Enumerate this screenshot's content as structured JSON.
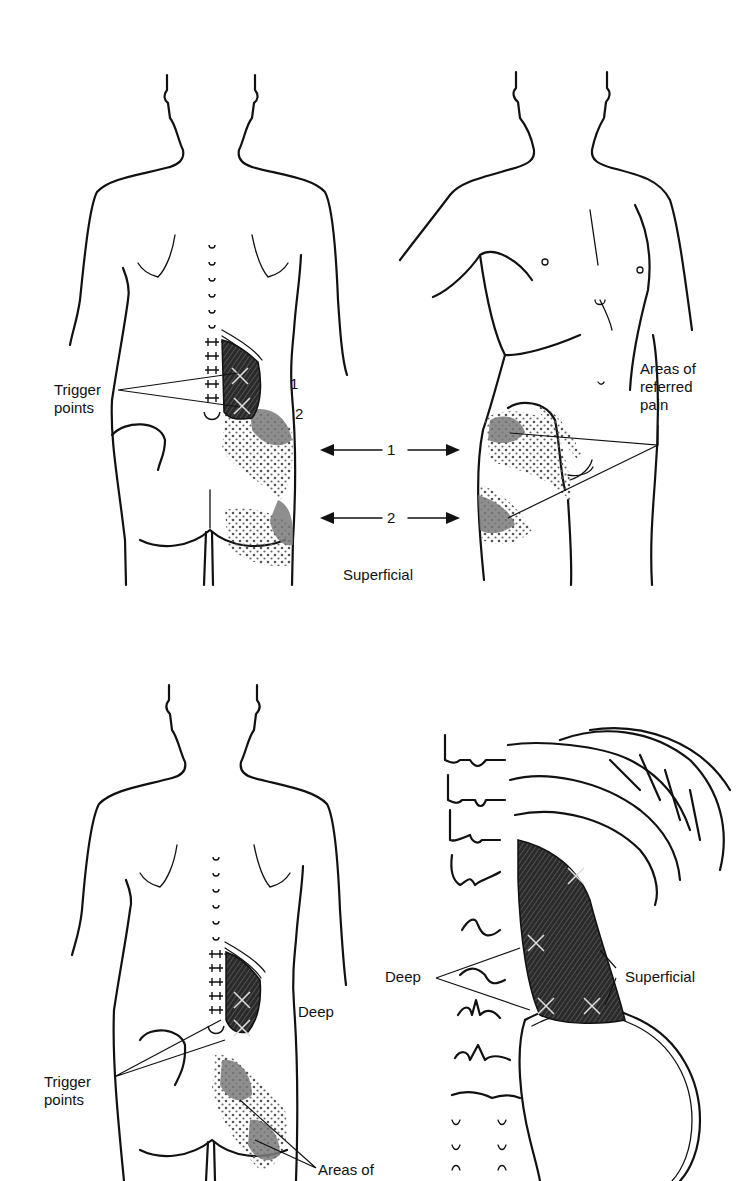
{
  "figure": {
    "panels": [
      {
        "id": "superficial",
        "views": [
          "posterior-torso",
          "anterolateral-torso"
        ],
        "labels": {
          "trigger_points": "Trigger\npoints",
          "marker_1": "1",
          "marker_2": "2",
          "arrow_1": "1",
          "arrow_2": "2",
          "areas_referred": "Areas of\nreferred\npain",
          "caption": "Superficial"
        }
      },
      {
        "id": "deep",
        "views": [
          "posterior-torso",
          "lumbar-spine-detail"
        ],
        "labels": {
          "trigger_points": "Trigger\npoints",
          "deep": "Deep",
          "areas_of": "Areas of",
          "detail_deep": "Deep",
          "detail_superficial": "Superficial"
        }
      }
    ],
    "colors": {
      "line": "#111111",
      "dense_pain": "#7a7a7a",
      "background": "#ffffff"
    }
  }
}
